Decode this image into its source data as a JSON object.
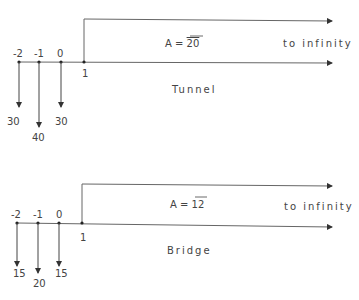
{
  "diagrams": [
    {
      "name": "Tunnel",
      "title": "Tunnel",
      "annuity_label_prefix": "A = ",
      "annuity_value": "20",
      "infinity_label": "to infinity",
      "time_points": [
        "-2",
        "-1",
        "0",
        "1"
      ],
      "cash_flows": [
        {
          "time": "-2",
          "amount": "30",
          "direction": "down"
        },
        {
          "time": "-1",
          "amount": "40",
          "direction": "down"
        },
        {
          "time": "0",
          "amount": "30",
          "direction": "down"
        }
      ]
    },
    {
      "name": "Bridge",
      "title": "Bridge",
      "annuity_label_prefix": "A = ",
      "annuity_value": "12",
      "infinity_label": "to infinity",
      "time_points": [
        "-2",
        "-1",
        "0",
        "1"
      ],
      "cash_flows": [
        {
          "time": "-2",
          "amount": "15",
          "direction": "down"
        },
        {
          "time": "-1",
          "amount": "20",
          "direction": "down"
        },
        {
          "time": "0",
          "amount": "15",
          "direction": "down"
        }
      ]
    }
  ],
  "colors": {
    "line": "#555555",
    "text": "#444444",
    "background": "#ffffff"
  }
}
